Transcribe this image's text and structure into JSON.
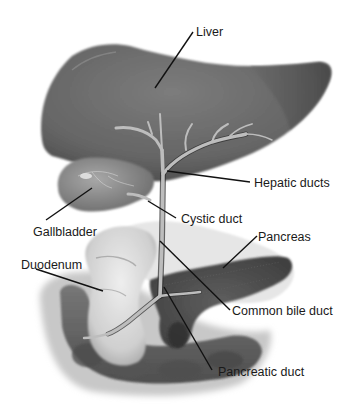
{
  "figure": {
    "labels": [
      {
        "id": "liver",
        "text": "Liver",
        "x": 196,
        "y": 26
      },
      {
        "id": "hepatic-ducts",
        "text": "Hepatic ducts",
        "x": 254,
        "y": 177
      },
      {
        "id": "gallbladder",
        "text": "Gallbladder",
        "x": 33,
        "y": 226
      },
      {
        "id": "cystic-duct",
        "text": "Cystic duct",
        "x": 181,
        "y": 213
      },
      {
        "id": "pancreas",
        "text": "Pancreas",
        "x": 258,
        "y": 231
      },
      {
        "id": "duodenum",
        "text": "Duodenum",
        "x": 21,
        "y": 259
      },
      {
        "id": "common-bile-duct",
        "text": "Common bile duct",
        "x": 232,
        "y": 305
      },
      {
        "id": "pancreatic-duct",
        "text": "Pancreatic duct",
        "x": 218,
        "y": 366
      }
    ],
    "colors": {
      "background": "#ffffff",
      "liver": "#6e6e6e",
      "liver_dark": "#4a4a4a",
      "gallbladder": "#8a8a8a",
      "duct": "#b8b8b8",
      "duct_dark": "#2a2a2a",
      "pancreas": "#555555",
      "duodenum": "#d6d6d6",
      "intestine": "#5a5a5a",
      "leader": "#111111",
      "text": "#1a1a1a"
    }
  }
}
